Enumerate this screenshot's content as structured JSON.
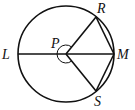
{
  "figure": {
    "stroke_color": "#111111",
    "background": "#ffffff",
    "circle": {
      "center": "P",
      "cx": 66,
      "cy": 54,
      "r": 48
    },
    "points": [
      {
        "name": "L",
        "x": 18,
        "y": 54,
        "label": "L"
      },
      {
        "name": "M",
        "x": 114,
        "y": 54,
        "label": "M"
      },
      {
        "name": "R",
        "x": 96,
        "y": 17,
        "label": "R"
      },
      {
        "name": "S",
        "x": 96,
        "y": 91,
        "label": "S"
      },
      {
        "name": "P",
        "x": 66,
        "y": 54,
        "label": "P"
      }
    ],
    "segments": [
      {
        "from": "L",
        "to": "M",
        "type": "diameter"
      },
      {
        "from": "P",
        "to": "R",
        "type": "radius"
      },
      {
        "from": "P",
        "to": "S",
        "type": "radius"
      },
      {
        "from": "R",
        "to": "M",
        "type": "chord"
      },
      {
        "from": "M",
        "to": "S",
        "type": "chord"
      }
    ],
    "angle_marks": [
      {
        "vertex": "P",
        "from": "R",
        "to": "S",
        "kind": "reflex-arc"
      }
    ]
  }
}
